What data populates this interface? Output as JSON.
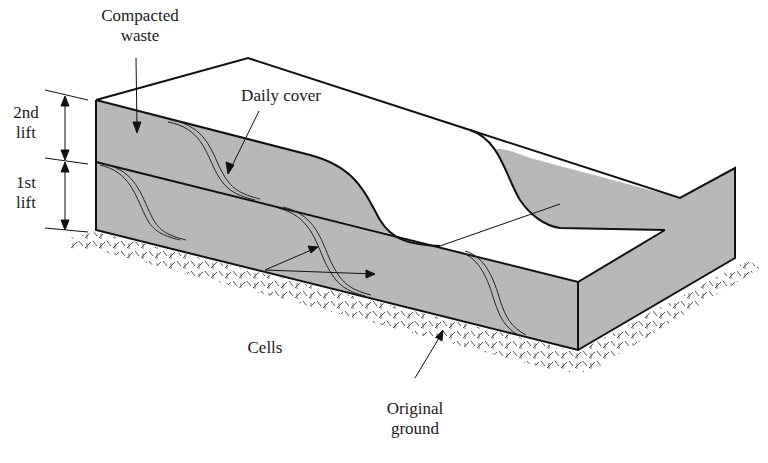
{
  "figure": {
    "type": "landfill cross-section (isometric block)",
    "colors": {
      "waste_fill": "#b8b8b8",
      "outline": "#111111",
      "background": "#ffffff",
      "ground_hatch": "#333333"
    }
  },
  "labels": {
    "compacted_waste_line1": "Compacted",
    "compacted_waste_line2": "waste",
    "daily_cover": "Daily cover",
    "second_lift_line1": "2nd",
    "second_lift_line2": "lift",
    "first_lift_line1": "1st",
    "first_lift_line2": "lift",
    "cells": "Cells",
    "original_ground_line1": "Original",
    "original_ground_line2": "ground"
  }
}
